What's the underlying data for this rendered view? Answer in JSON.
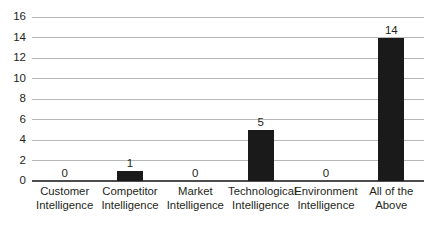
{
  "chart_data": {
    "type": "bar",
    "title": "",
    "subtitle": "",
    "xlabel": "",
    "ylabel": "",
    "ylim": [
      0,
      16
    ],
    "ytick_step": 2,
    "yticks": [
      16,
      14,
      12,
      10,
      8,
      6,
      4,
      2,
      0
    ],
    "grid": true,
    "legend": false,
    "legend_position": "none",
    "categories": [
      "Customer Intelligence",
      "Competitor Intelligence",
      "Market Intelligence",
      "Technological Intelligence",
      "Environment Intelligence",
      "All of the Above"
    ],
    "category_lines": [
      [
        "Customer",
        "Intelligence"
      ],
      [
        "Competitor",
        "Intelligence"
      ],
      [
        "Market",
        "Intelligence"
      ],
      [
        "Technological",
        "Intelligence"
      ],
      [
        "Environment",
        "Intelligence"
      ],
      [
        "All of the",
        "Above"
      ]
    ],
    "values": [
      0,
      1,
      0,
      5,
      0,
      14
    ],
    "data_labels": [
      "0",
      "1",
      "0",
      "5",
      "0",
      "14"
    ],
    "bar_color": "#1a1a1a",
    "gridline_color": "#b7b7b7",
    "axis_color": "#4d4d4d",
    "background_color": "#ffffff",
    "text_color": "#231f20"
  }
}
